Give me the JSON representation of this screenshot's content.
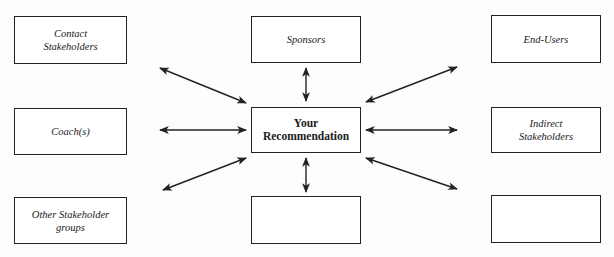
{
  "diagram": {
    "center": {
      "label": "Your\nRecommendation",
      "box": [
        251,
        107,
        110,
        46
      ]
    },
    "nodes": [
      {
        "id": "contact",
        "label": "Contact\nStakeholders",
        "box": [
          14,
          16,
          113,
          48
        ]
      },
      {
        "id": "sponsors",
        "label": "Sponsors",
        "box": [
          251,
          16,
          110,
          47
        ]
      },
      {
        "id": "end-users",
        "label": "End-Users",
        "box": [
          491,
          15,
          110,
          48
        ]
      },
      {
        "id": "coach",
        "label": "Coach(s)",
        "box": [
          14,
          108,
          113,
          47
        ]
      },
      {
        "id": "indirect",
        "label": "Indirect\nStakeholders",
        "box": [
          491,
          107,
          110,
          46
        ]
      },
      {
        "id": "other",
        "label": "Other Stakeholder\ngroups",
        "box": [
          14,
          197,
          113,
          47
        ]
      },
      {
        "id": "blank-bottom-center",
        "label": "",
        "box": [
          251,
          196,
          110,
          48
        ]
      },
      {
        "id": "blank-bottom-right",
        "label": "",
        "box": [
          491,
          195,
          110,
          48
        ]
      }
    ],
    "arrows": [
      {
        "from": "contact",
        "to": "center",
        "x1": 160,
        "y1": 68,
        "x2": 246,
        "y2": 103
      },
      {
        "from": "coach",
        "to": "center",
        "x1": 160,
        "y1": 130,
        "x2": 246,
        "y2": 130
      },
      {
        "from": "other",
        "to": "center",
        "x1": 163,
        "y1": 190,
        "x2": 246,
        "y2": 158
      },
      {
        "from": "sponsors",
        "to": "center",
        "x1": 306,
        "y1": 68,
        "x2": 306,
        "y2": 101
      },
      {
        "from": "blank-bottom-center",
        "to": "center",
        "x1": 306,
        "y1": 192,
        "x2": 306,
        "y2": 158
      },
      {
        "from": "end-users",
        "to": "center",
        "x1": 457,
        "y1": 67,
        "x2": 366,
        "y2": 102
      },
      {
        "from": "indirect",
        "to": "center",
        "x1": 457,
        "y1": 130,
        "x2": 366,
        "y2": 130
      },
      {
        "from": "blank-bottom-right",
        "to": "center",
        "x1": 457,
        "y1": 189,
        "x2": 366,
        "y2": 158
      }
    ],
    "colors": {
      "stroke": "#222222",
      "background": "#fdfdfd"
    }
  }
}
